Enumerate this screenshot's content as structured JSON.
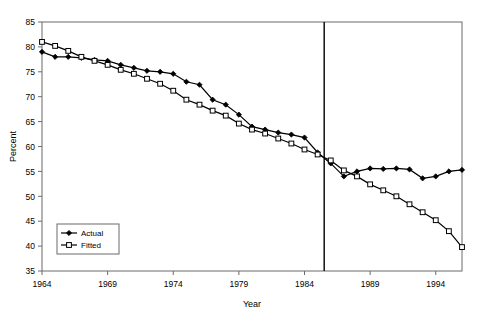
{
  "chart_data": {
    "type": "line",
    "title": "",
    "xlabel": "Year",
    "ylabel": "Percent",
    "xlim": [
      1964,
      1996
    ],
    "ylim": [
      35,
      85
    ],
    "yticks": [
      35,
      40,
      45,
      50,
      55,
      60,
      65,
      70,
      75,
      80,
      85
    ],
    "xticks": [
      1964,
      1969,
      1974,
      1979,
      1984,
      1989,
      1994
    ],
    "grid": false,
    "legend_position": "bottom-left",
    "annotations": [
      {
        "name": "forecast-divider",
        "type": "vline",
        "x": 1985.5,
        "label": ""
      }
    ],
    "x": [
      1964,
      1965,
      1966,
      1967,
      1968,
      1969,
      1970,
      1971,
      1972,
      1973,
      1974,
      1975,
      1976,
      1977,
      1978,
      1979,
      1980,
      1981,
      1982,
      1983,
      1984,
      1985,
      1986,
      1987,
      1988,
      1989,
      1990,
      1991,
      1992,
      1993,
      1994,
      1995,
      1996
    ],
    "series": [
      {
        "name": "Actual",
        "marker": "filled-diamond",
        "color": "#000000",
        "values": [
          79.0,
          78.0,
          78.0,
          77.8,
          77.4,
          77.2,
          76.4,
          75.8,
          75.2,
          75.0,
          74.6,
          73.0,
          72.4,
          69.4,
          68.4,
          66.4,
          64.0,
          63.4,
          62.8,
          62.4,
          61.8,
          58.8,
          56.6,
          54.0,
          55.0,
          55.6,
          55.5,
          55.6,
          55.4,
          53.6,
          54.0,
          55.0,
          55.3
        ]
      },
      {
        "name": "Fitted",
        "marker": "open-square",
        "color": "#000000",
        "values": [
          81.0,
          80.2,
          79.2,
          78.0,
          77.2,
          76.4,
          75.4,
          74.6,
          73.6,
          72.6,
          71.2,
          69.4,
          68.4,
          67.2,
          66.2,
          64.6,
          63.4,
          62.6,
          61.6,
          60.6,
          59.4,
          58.4,
          57.2,
          55.2,
          54.0,
          52.4,
          51.2,
          50.0,
          48.4,
          46.8,
          45.2,
          43.0,
          39.8
        ]
      }
    ]
  },
  "axes": {
    "y_label": "Percent",
    "x_label": "Year",
    "y_tick_labels": [
      "35",
      "40",
      "45",
      "50",
      "55",
      "60",
      "65",
      "70",
      "75",
      "80",
      "85"
    ],
    "x_tick_labels": [
      "1964",
      "1969",
      "1974",
      "1979",
      "1984",
      "1989",
      "1994"
    ]
  },
  "legend": {
    "items": [
      {
        "label": "Actual",
        "marker": "filled-diamond"
      },
      {
        "label": "Fitted",
        "marker": "open-square"
      }
    ]
  },
  "colors": {
    "line": "#000000",
    "axis": "#6b6b6b",
    "background": "#ffffff",
    "marker_fill_open": "#ffffff"
  }
}
